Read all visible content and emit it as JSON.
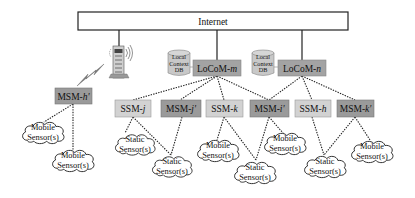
{
  "diagram": {
    "internet": {
      "label": "Internet"
    },
    "colors": {
      "msm_fill": "#9a9a9a",
      "ssm_fill": "#d2d2d2",
      "locom_fill": "#a3a3a3",
      "db_fill": "#c8c8c8",
      "line": "#222222"
    },
    "locoms": [
      {
        "id": "locom-m",
        "prefix": "LoCoM-",
        "suffix": "m",
        "db": [
          "Local",
          "Context",
          "DB"
        ]
      },
      {
        "id": "locom-n",
        "prefix": "LoCoM-",
        "suffix": "n",
        "db": [
          "Local",
          "Context",
          "DB"
        ]
      }
    ],
    "base_station": {
      "icon": "cell-tower-icon",
      "link_icon": "wireless-lightning-icon"
    },
    "msm_h": {
      "prefix": "MSM-",
      "suffix": "h'"
    },
    "row_nodes": [
      {
        "prefix": "SSM-",
        "suffix": "j",
        "type": "ssm"
      },
      {
        "prefix": "MSM-",
        "suffix": "j'",
        "type": "msm"
      },
      {
        "prefix": "SSM-",
        "suffix": "k",
        "type": "ssm"
      },
      {
        "prefix": "MSM-",
        "suffix": "i'",
        "type": "msm"
      },
      {
        "prefix": "SSM-",
        "suffix": "h",
        "type": "ssm"
      },
      {
        "prefix": "MSM-",
        "suffix": "k'",
        "type": "msm"
      }
    ],
    "sensors": [
      {
        "line1": "Mobile",
        "line2": "Sensor(s)"
      },
      {
        "line1": "Mobile",
        "line2": "Sensor(s)"
      },
      {
        "line1": "Static",
        "line2": "Sensor(s)"
      },
      {
        "line1": "Static",
        "line2": "Sensor(s)"
      },
      {
        "line1": "Mobile",
        "line2": "Sensor(s)"
      },
      {
        "line1": "Static",
        "line2": "Sensor(s)"
      },
      {
        "line1": "Mobile",
        "line2": "Sensor(s)"
      },
      {
        "line1": "Static",
        "line2": "Sensor(s)"
      },
      {
        "line1": "Mobile",
        "line2": "Sensor(s)"
      }
    ]
  }
}
